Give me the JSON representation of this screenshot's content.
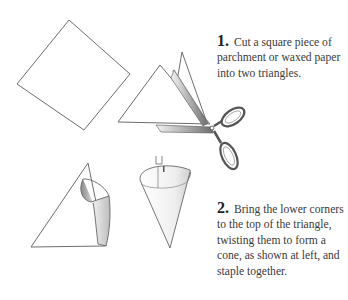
{
  "steps": [
    {
      "number": "1.",
      "text": "Cut a square piece of parchment or waxed paper into two triangles."
    },
    {
      "number": "2.",
      "text": "Bring the lower corners to the top of the triangle, twisting them to form a cone, as shown at left, and staple together."
    }
  ],
  "illustrations": [
    {
      "name": "square-paper",
      "description": "square of paper rotated like a diamond"
    },
    {
      "name": "triangles-with-scissors",
      "description": "square cut into two triangles with scissors"
    },
    {
      "name": "partially-folded-cone",
      "description": "triangle with corner being rolled into cone"
    },
    {
      "name": "finished-cone",
      "description": "paper cone stapled together"
    }
  ]
}
